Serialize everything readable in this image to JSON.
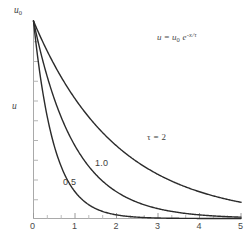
{
  "figure": {
    "background_color": "#ffffff",
    "axis_color": "#a9a9a9",
    "curve_color": "#2b2b2b",
    "text_color": "#3d3d3d"
  },
  "annotations": {
    "equation": {
      "lhs": "u",
      "equals": " = ",
      "base": "u",
      "base_sub": "0",
      "e": " e",
      "exponent": "-x/τ",
      "full_text": "u = u₀ e^(-x/τ)"
    }
  },
  "axes": {
    "y": {
      "name": "u",
      "top_label": "u",
      "top_label_sub": "0",
      "min": 0,
      "max": 1,
      "minor_tick_count": 10
    },
    "x": {
      "name": "",
      "min": 0,
      "max": 5,
      "tick_labels": [
        "0",
        "1",
        "2",
        "3",
        "4",
        "5"
      ],
      "tick_values": [
        0,
        1,
        2,
        3,
        4,
        5
      ],
      "minor_ticks_per_interval": 2
    }
  },
  "chart_data": {
    "type": "line",
    "title": "",
    "subtitle": "",
    "xlabel": "",
    "ylabel": "u",
    "xlim": [
      0,
      5
    ],
    "ylim": [
      0,
      1
    ],
    "grid": false,
    "legend_position": "inline-curve-labels",
    "x_tick_labels": [
      "0",
      "1",
      "2",
      "3",
      "4",
      "5"
    ],
    "y_tick_labels": [
      "0",
      "u₀"
    ],
    "annotations": [
      {
        "text": "u = u₀ e^(-x/τ)",
        "x": 2.85,
        "y": 0.91
      },
      {
        "text": "τ = 2",
        "x": 2.4,
        "y": 0.35
      },
      {
        "text": "1.0",
        "x": 1.65,
        "y": 0.23
      },
      {
        "text": "0.5",
        "x": 0.93,
        "y": 0.145
      }
    ],
    "equation": "u = u_0 * exp(-x/tau)",
    "series": [
      {
        "name": "0.5",
        "tau": 0.5,
        "label": "0.5",
        "x": [
          0,
          0.25,
          0.5,
          0.75,
          1,
          1.25,
          1.5,
          1.75,
          2,
          2.5,
          3,
          3.5,
          4,
          4.5,
          5
        ],
        "values": [
          1,
          0.607,
          0.368,
          0.223,
          0.135,
          0.082,
          0.05,
          0.03,
          0.018,
          0.0067,
          0.0025,
          0.0009,
          0.0003,
          0.0001,
          5e-05
        ]
      },
      {
        "name": "1.0",
        "tau": 1.0,
        "label": "1.0",
        "x": [
          0,
          0.25,
          0.5,
          0.75,
          1,
          1.5,
          2,
          2.5,
          3,
          3.5,
          4,
          4.5,
          5
        ],
        "values": [
          1,
          0.779,
          0.607,
          0.472,
          0.368,
          0.223,
          0.135,
          0.082,
          0.05,
          0.03,
          0.018,
          0.011,
          0.0067
        ]
      },
      {
        "name": "τ = 2",
        "tau": 2.0,
        "label": "τ = 2",
        "x": [
          0,
          0.5,
          1,
          1.5,
          2,
          2.5,
          3,
          3.5,
          4,
          4.5,
          5
        ],
        "values": [
          1,
          0.779,
          0.607,
          0.472,
          0.368,
          0.287,
          0.223,
          0.174,
          0.135,
          0.105,
          0.082
        ]
      }
    ]
  }
}
